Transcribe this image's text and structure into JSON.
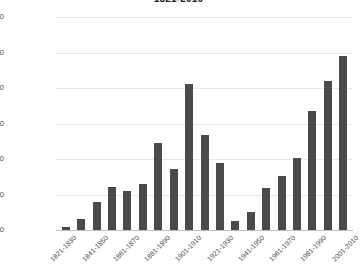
{
  "chart_data": {
    "type": "bar",
    "title": "1821-2010",
    "xlabel": "",
    "ylabel": "",
    "ylim": [
      0,
      12000000
    ],
    "ytick_labels": [
      "12,000,000",
      "10,000,000",
      "8,000,000",
      "6,000,000",
      "4,000,000",
      "2,000,000",
      "0"
    ],
    "ytick_values": [
      12000000,
      10000000,
      8000000,
      6000000,
      4000000,
      2000000,
      0
    ],
    "grid": true,
    "legend": "none",
    "bar_color": "#4a4a4a",
    "gridline_color": "#e8e8e8",
    "axis_color": "#bdbdbd",
    "categories": [
      "1821-1830",
      "1831-1840",
      "1841-1850",
      "1851-1860",
      "1861-1870",
      "1871-1880",
      "1881-1890",
      "1891-1900",
      "1901-1910",
      "1911-1920",
      "1921-1930",
      "1931-1940",
      "1941-1950",
      "1951-1960",
      "1961-1970",
      "1971-1980",
      "1981-1990",
      "1991-2000",
      "2001-2010"
    ],
    "values": [
      180000,
      600000,
      1600000,
      2450000,
      2200000,
      2600000,
      4900000,
      3450000,
      8200000,
      5350000,
      3800000,
      500000,
      1000000,
      2350000,
      3050000,
      4050000,
      6700000,
      8400000,
      9800000
    ],
    "visible_xtick_labels": [
      "1821-1830",
      "1841-1850",
      "1861-1870",
      "1881-1890",
      "1901-1910",
      "1921-1930",
      "1941-1950",
      "1961-1970",
      "1981-1990",
      "2001-2010"
    ],
    "visible_xtick_indices": [
      0,
      2,
      4,
      6,
      8,
      10,
      12,
      14,
      16,
      18
    ]
  }
}
